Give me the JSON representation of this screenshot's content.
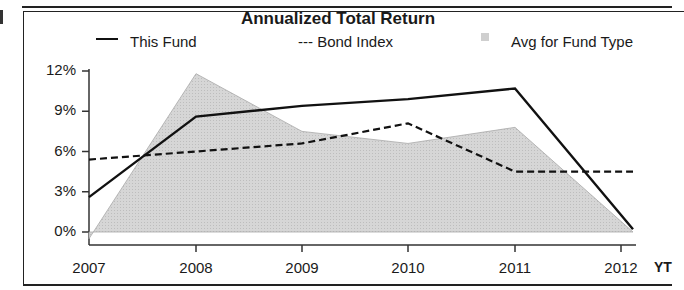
{
  "chart_data": {
    "type": "line",
    "title": "Annualized Total Return",
    "xlabel": "",
    "ylabel": "",
    "categories": [
      "2007",
      "2008",
      "2009",
      "2010",
      "2011",
      "2012"
    ],
    "extra_x_label": "YTD",
    "ylim": [
      0,
      12
    ],
    "y_ticks": [
      "12%",
      "9%",
      "6%",
      "3%",
      "0%"
    ],
    "grid": false,
    "legend_position": "top",
    "series": [
      {
        "name": "This Fund",
        "style": "solid-line",
        "values": [
          2.6,
          8.6,
          9.4,
          9.9,
          10.7,
          0.2
        ]
      },
      {
        "name": "Bond Index",
        "style": "dashed-line",
        "values": [
          5.4,
          6.0,
          6.6,
          8.1,
          4.5,
          4.5
        ]
      },
      {
        "name": "Avg for Fund Type",
        "style": "shaded-area",
        "values": [
          -0.5,
          11.8,
          7.5,
          6.6,
          7.8,
          0.0
        ]
      }
    ]
  },
  "legend": {
    "fund_label": "This Fund",
    "bond_label": "--- Bond Index",
    "avg_label": "Avg for Fund Type"
  },
  "axis": {
    "y": [
      "12%",
      "9%",
      "6%",
      "3%",
      "0%"
    ],
    "x": [
      "2007",
      "2008",
      "2009",
      "2010",
      "2011",
      "2012"
    ],
    "x_suffix": "YT"
  },
  "colors": {
    "fund": "#111111",
    "bond": "#111111",
    "avg_fill": "#d4d4d4",
    "avg_stroke": "#a8a8a8",
    "axis": "#333333"
  }
}
